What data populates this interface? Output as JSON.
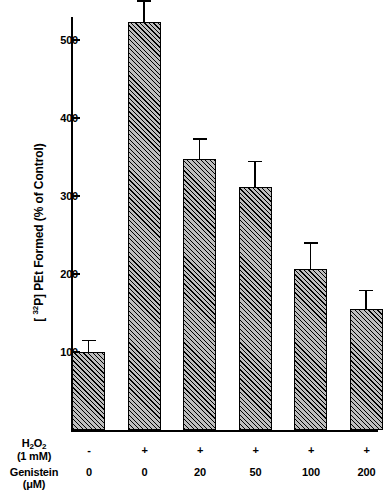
{
  "chart_data": {
    "type": "bar",
    "title": "",
    "xlabel": "",
    "ylabel": "[ 32P] PEt Formed (% of Control)",
    "ylabel_prefix": "[ ",
    "ylabel_sup": "32",
    "ylabel_suffix": "P] PEt Formed (% of Control)",
    "ylim": [
      0,
      560
    ],
    "yticks": [
      100,
      200,
      300,
      400,
      500
    ],
    "ytick_labels": [
      "100",
      "200",
      "300",
      "400",
      "500"
    ],
    "grid": false,
    "legend": "none",
    "categories": [
      "1",
      "2",
      "3",
      "4",
      "5",
      "6"
    ],
    "values": [
      100,
      523,
      348,
      312,
      207,
      155
    ],
    "errors": [
      16,
      28,
      26,
      33,
      34,
      25
    ],
    "bar_fill": "#bdbdbd",
    "bar_edge": "#000000",
    "hatch": "diagonal-45",
    "conditions": {
      "row1_label_line1": "H2O2",
      "row1_label_line1_main": "H",
      "row1_label_line1_sub1": "2",
      "row1_label_line1_mid": "O",
      "row1_label_line1_sub2": "2",
      "row1_label_line2": "(1 mM)",
      "row1_values": [
        "-",
        "+",
        "+",
        "+",
        "+",
        "+"
      ],
      "row2_label_line1": "Genistein",
      "row2_label_line2": "(μM)",
      "row2_values": [
        "0",
        "0",
        "20",
        "50",
        "100",
        "200"
      ]
    }
  }
}
